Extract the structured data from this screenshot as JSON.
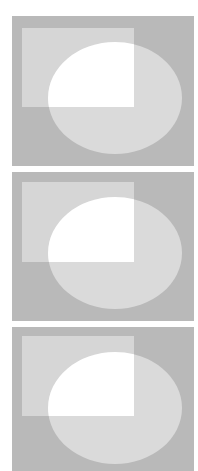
{
  "colors": {
    "page_background": "#ffffff",
    "panel_background": "#b9b9b9",
    "rectangle_fill": "#d6d6d6",
    "ellipse_fill": "#dadada",
    "intersection_fill": "#ffffff"
  },
  "panels": [
    {
      "name": "panel-1",
      "x": 12,
      "y": 16,
      "width": 182,
      "height": 150,
      "rect": {
        "x": 10,
        "y": 12,
        "width": 112,
        "height": 79
      },
      "ellipse": {
        "cx": 103,
        "cy": 82,
        "rx": 67,
        "ry": 56
      }
    },
    {
      "name": "panel-2",
      "x": 12,
      "y": 172,
      "width": 182,
      "height": 149,
      "rect": {
        "x": 10,
        "y": 10,
        "width": 112,
        "height": 80
      },
      "ellipse": {
        "cx": 103,
        "cy": 81,
        "rx": 67,
        "ry": 56
      }
    },
    {
      "name": "panel-3",
      "x": 12,
      "y": 327,
      "width": 182,
      "height": 144,
      "rect": {
        "x": 10,
        "y": 9,
        "width": 112,
        "height": 80
      },
      "ellipse": {
        "cx": 103,
        "cy": 81,
        "rx": 67,
        "ry": 56
      }
    }
  ]
}
